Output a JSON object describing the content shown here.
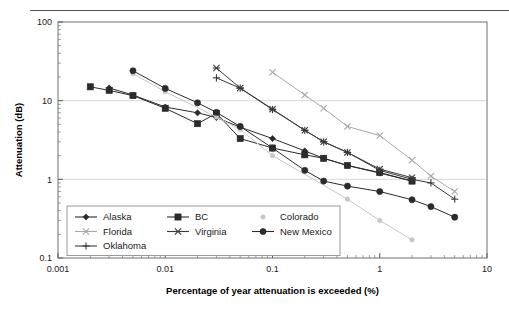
{
  "figure": {
    "background": "#ffffff",
    "top_rule_color": "#555555",
    "frame_color": "#6e6e6e",
    "gridline_color": "#d9d9d9"
  },
  "chart_data": {
    "type": "line",
    "title": "",
    "xlabel": "Percentage of year attenuation is exceeded (%)",
    "ylabel": "Attenuation (dB)",
    "xscale": "log",
    "yscale": "log",
    "xlim": [
      0.001,
      10
    ],
    "ylim": [
      0.1,
      100
    ],
    "xticks": [
      0.001,
      0.01,
      0.1,
      1,
      10
    ],
    "xtick_labels": [
      "0.001",
      "0.01",
      "0.1",
      "1",
      "10"
    ],
    "yticks": [
      0.1,
      1,
      10,
      100
    ],
    "ytick_labels": [
      "0.1",
      "1",
      "10",
      "100"
    ],
    "grid": "horizontal-major",
    "legend_position": "lower-left-inside",
    "series": [
      {
        "name": "Alaska",
        "marker": "diamond",
        "color": "#2b2b2b",
        "x": [
          0.003,
          0.005,
          0.01,
          0.02,
          0.03,
          0.05,
          0.1,
          0.2,
          0.3,
          0.5,
          1,
          2
        ],
        "y": [
          14.5,
          11.8,
          8.3,
          7.0,
          6.1,
          4.6,
          3.3,
          2.3,
          1.85,
          1.5,
          1.2,
          0.95
        ]
      },
      {
        "name": "BC",
        "marker": "square",
        "color": "#2b2b2b",
        "x": [
          0.002,
          0.003,
          0.005,
          0.01,
          0.02,
          0.03,
          0.05,
          0.1,
          0.2,
          0.3,
          0.5,
          1,
          2
        ],
        "y": [
          15.0,
          13.5,
          11.6,
          8.0,
          5.1,
          6.9,
          3.3,
          2.5,
          2.05,
          1.85,
          1.5,
          1.22,
          0.95
        ]
      },
      {
        "name": "Colorado",
        "marker": "dot-faint",
        "color": "#c7c7c7",
        "x": [
          0.005,
          0.01,
          0.03,
          0.05,
          0.1,
          0.5,
          1,
          2
        ],
        "y": [
          22.0,
          13.0,
          6.2,
          4.3,
          2.0,
          0.56,
          0.3,
          0.17
        ]
      },
      {
        "name": "Florida",
        "marker": "x-cross",
        "color": "#a8a8a8",
        "x": [
          0.1,
          0.2,
          0.3,
          0.5,
          1,
          2,
          3,
          5
        ],
        "y": [
          23.0,
          11.8,
          8.0,
          4.7,
          3.6,
          1.75,
          1.1,
          0.7
        ]
      },
      {
        "name": "Virginia",
        "marker": "asterisk",
        "color": "#3a3a3a",
        "x": [
          0.03,
          0.05,
          0.1,
          0.2,
          0.3,
          0.5,
          1,
          2
        ],
        "y": [
          26.0,
          14.5,
          7.8,
          4.2,
          3.0,
          2.2,
          1.35,
          1.05
        ]
      },
      {
        "name": "New Mexico",
        "marker": "circle",
        "color": "#2b2b2b",
        "x": [
          0.005,
          0.01,
          0.02,
          0.03,
          0.05,
          0.1,
          0.2,
          0.3,
          0.5,
          1,
          2,
          3,
          5
        ],
        "y": [
          24.0,
          14.3,
          9.4,
          7.1,
          4.7,
          2.5,
          1.3,
          0.95,
          0.82,
          0.7,
          0.55,
          0.45,
          0.33
        ]
      },
      {
        "name": "Oklahoma",
        "marker": "plus",
        "color": "#3a3a3a",
        "x": [
          0.03,
          0.05,
          0.1,
          0.2,
          0.3,
          0.5,
          1,
          2,
          3,
          5
        ],
        "y": [
          19.5,
          14.4,
          7.7,
          4.2,
          3.0,
          2.2,
          1.3,
          1.0,
          0.9,
          0.56
        ]
      }
    ]
  },
  "legend": {
    "rows": [
      [
        "Alaska",
        "BC",
        "Colorado"
      ],
      [
        "Florida",
        "Virginia",
        "New Mexico"
      ],
      [
        "Oklahoma"
      ]
    ]
  }
}
